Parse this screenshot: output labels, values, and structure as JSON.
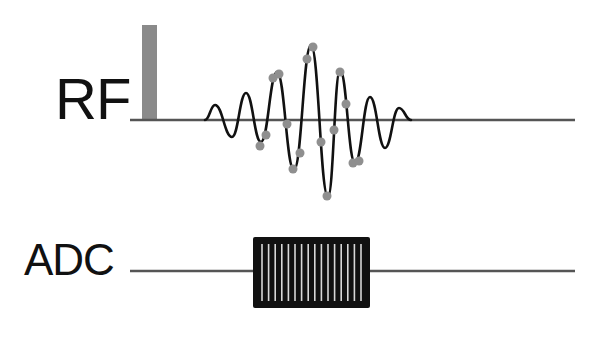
{
  "diagram": {
    "title": "",
    "rows": [
      {
        "label": "RF",
        "baseline": {
          "x1": 130,
          "x2": 575,
          "y": 120,
          "color": "#555555"
        },
        "pulse_bar": {
          "x": 142,
          "y": 25,
          "width": 15,
          "height": 95,
          "color": "#8a8a8a"
        },
        "waveform": {
          "type": "modulated sinc-like pulse",
          "color": "#111111",
          "points": [
            [
              205,
              120
            ],
            [
              215,
              105
            ],
            [
              232,
              137
            ],
            [
              246,
              93
            ],
            [
              261,
              142
            ],
            [
              277,
              72
            ],
            [
              294,
              170
            ],
            [
              311,
              45
            ],
            [
              328,
              197
            ],
            [
              340,
              70
            ],
            [
              355,
              163
            ],
            [
              370,
              97
            ],
            [
              385,
              148
            ],
            [
              399,
              108
            ],
            [
              411,
              120
            ]
          ]
        },
        "sample_dots": {
          "color": "#8f8f8f",
          "radius": 4.5,
          "points": [
            [
              260,
              146
            ],
            [
              266,
              135
            ],
            [
              273,
              78
            ],
            [
              279,
              74
            ],
            [
              287,
              124
            ],
            [
              293,
              169
            ],
            [
              300,
              153
            ],
            [
              307,
              59
            ],
            [
              313,
              47
            ],
            [
              321,
              142
            ],
            [
              327,
              196
            ],
            [
              334,
              130
            ],
            [
              340,
              72
            ],
            [
              346,
              104
            ],
            [
              353,
              163
            ],
            [
              359,
              161
            ]
          ]
        }
      },
      {
        "label": "ADC",
        "baseline": {
          "x1": 130,
          "x2": 575,
          "y": 271,
          "color": "#555555"
        },
        "readout_box": {
          "x": 253,
          "y": 237,
          "width": 117,
          "height": 71,
          "fill": "#111111",
          "stripe_color": "#d8d8d8",
          "stripe_count": 16
        }
      }
    ]
  }
}
